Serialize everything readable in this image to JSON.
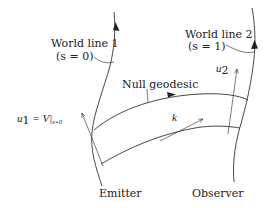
{
  "figure": {
    "type": "spacetime-diagram",
    "background": "#ffffff",
    "stroke_color": "#333333"
  },
  "labels": {
    "world_line_1": "World line 1",
    "world_line_1_param": "(s = 0)",
    "world_line_2": "World line 2",
    "world_line_2_param": "(s = 1)",
    "null_geodesic": "Null geodesic",
    "u1_label": "u",
    "u1_sub": "1",
    "u1_rhs": " = V|",
    "u1_rhs_sub": "s=0",
    "u2_label": "u",
    "u2_sub": "2",
    "k_label": "k",
    "emitter": "Emitter",
    "observer": "Observer"
  },
  "elements": {
    "world_lines": [
      {
        "name": "World line 1",
        "param": "s = 0",
        "role": "Emitter"
      },
      {
        "name": "World line 2",
        "param": "s = 1",
        "role": "Observer"
      }
    ],
    "null_geodesics": 2,
    "vectors": [
      "u1 = V|s=0",
      "u2",
      "k"
    ]
  }
}
